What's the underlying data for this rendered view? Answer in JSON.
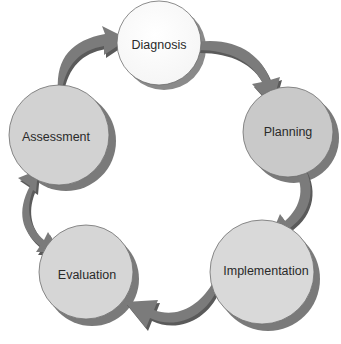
{
  "diagram": {
    "type": "cycle",
    "colors": {
      "arrow": "#7b7b7b",
      "arrow_shadow": "#5a5a5a",
      "node_border": "#6e6e6e",
      "node_shadow": "#7a7a7a",
      "text": "#2a2a2a"
    },
    "nodes": [
      {
        "id": "diagnosis",
        "label": "Diagnosis",
        "fill": "#ffffff"
      },
      {
        "id": "planning",
        "label": "Planning",
        "fill": "#c9c9c9"
      },
      {
        "id": "implementation",
        "label": "Implementation",
        "fill": "#d9d9d9"
      },
      {
        "id": "evaluation",
        "label": "Evaluation",
        "fill": "#d6d6d6"
      },
      {
        "id": "assessment",
        "label": "Assessment",
        "fill": "#d2d2d2"
      }
    ],
    "edges": [
      {
        "from": "assessment",
        "to": "diagnosis",
        "direction": "forward"
      },
      {
        "from": "diagnosis",
        "to": "planning",
        "direction": "forward"
      },
      {
        "from": "planning",
        "to": "implementation",
        "direction": "forward"
      },
      {
        "from": "implementation",
        "to": "evaluation",
        "direction": "forward"
      },
      {
        "from": "evaluation",
        "to": "assessment",
        "direction": "both"
      }
    ]
  }
}
